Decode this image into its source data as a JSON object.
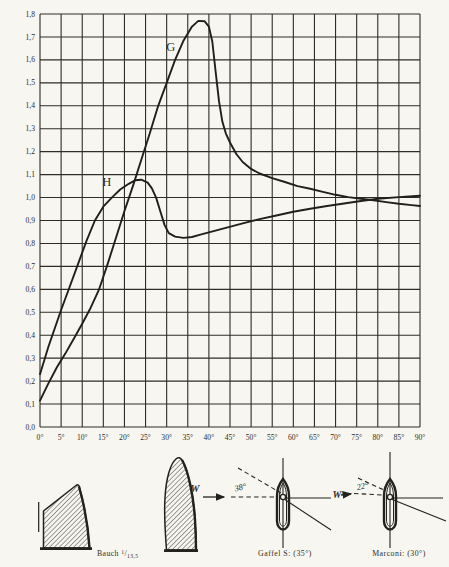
{
  "page": {
    "description_colors": {
      "paper": "#f8f6f1",
      "ink": "#23221c"
    }
  },
  "chart_data": {
    "type": "line",
    "title": "",
    "xlabel": "",
    "ylabel": "",
    "xlim": [
      0,
      90
    ],
    "ylim": [
      0,
      1.8
    ],
    "grid": "on",
    "x_ticks": [
      "0°",
      "5°",
      "10°",
      "15°",
      "20°",
      "25°",
      "30°",
      "35°",
      "40°",
      "45°",
      "50°",
      "55°",
      "60°",
      "65°",
      "70°",
      "75°",
      "80°",
      "85°",
      "90°"
    ],
    "y_ticks": [
      "0,0",
      "0,1",
      "0,2",
      "0,3",
      "0,4",
      "0,5",
      "0,6",
      "0,7",
      "0,8",
      "0,9",
      "1,0",
      "1,1",
      "1,2",
      "1,3",
      "1,4",
      "1,5",
      "1,6",
      "1,7",
      "1,8"
    ],
    "series": [
      {
        "name": "G",
        "label_pos": [
          31,
          1.64
        ],
        "points": [
          [
            0,
            0.115
          ],
          [
            2,
            0.19
          ],
          [
            4,
            0.26
          ],
          [
            6,
            0.32
          ],
          [
            8,
            0.385
          ],
          [
            10,
            0.45
          ],
          [
            12,
            0.52
          ],
          [
            14,
            0.6
          ],
          [
            16,
            0.71
          ],
          [
            18,
            0.825
          ],
          [
            20,
            0.94
          ],
          [
            22,
            1.05
          ],
          [
            24,
            1.165
          ],
          [
            26,
            1.28
          ],
          [
            28,
            1.4
          ],
          [
            30,
            1.5
          ],
          [
            32,
            1.6
          ],
          [
            34,
            1.685
          ],
          [
            36,
            1.745
          ],
          [
            37.5,
            1.77
          ],
          [
            39,
            1.768
          ],
          [
            40,
            1.745
          ],
          [
            40.8,
            1.68
          ],
          [
            41.6,
            1.55
          ],
          [
            42.4,
            1.42
          ],
          [
            43.2,
            1.33
          ],
          [
            44,
            1.28
          ],
          [
            45,
            1.24
          ],
          [
            46.5,
            1.19
          ],
          [
            48,
            1.155
          ],
          [
            50,
            1.125
          ],
          [
            52,
            1.105
          ],
          [
            55,
            1.085
          ],
          [
            58,
            1.068
          ],
          [
            61,
            1.05
          ],
          [
            64,
            1.038
          ],
          [
            67,
            1.025
          ],
          [
            70,
            1.012
          ],
          [
            73,
            1.002
          ],
          [
            76,
            0.995
          ],
          [
            79,
            0.988
          ],
          [
            82,
            0.98
          ],
          [
            85,
            0.973
          ],
          [
            88,
            0.967
          ],
          [
            90,
            0.963
          ]
        ]
      },
      {
        "name": "H",
        "label_pos": [
          15.8,
          1.05
        ],
        "points": [
          [
            0,
            0.23
          ],
          [
            2,
            0.35
          ],
          [
            5,
            0.51
          ],
          [
            7,
            0.61
          ],
          [
            9,
            0.71
          ],
          [
            11,
            0.81
          ],
          [
            13,
            0.9
          ],
          [
            15,
            0.96
          ],
          [
            17,
            1.0
          ],
          [
            19,
            1.035
          ],
          [
            21,
            1.06
          ],
          [
            22.5,
            1.075
          ],
          [
            24,
            1.078
          ],
          [
            25.5,
            1.065
          ],
          [
            26.5,
            1.04
          ],
          [
            27.5,
            1.0
          ],
          [
            28.5,
            0.94
          ],
          [
            29.5,
            0.88
          ],
          [
            30.5,
            0.845
          ],
          [
            32,
            0.83
          ],
          [
            34,
            0.824
          ],
          [
            36,
            0.828
          ],
          [
            38,
            0.838
          ],
          [
            40,
            0.848
          ],
          [
            44,
            0.868
          ],
          [
            48,
            0.888
          ],
          [
            52,
            0.906
          ],
          [
            56,
            0.922
          ],
          [
            60,
            0.938
          ],
          [
            64,
            0.951
          ],
          [
            68,
            0.963
          ],
          [
            72,
            0.974
          ],
          [
            76,
            0.985
          ],
          [
            80,
            0.995
          ],
          [
            85,
            1.002
          ],
          [
            90,
            1.008
          ]
        ]
      }
    ]
  },
  "footer": {
    "bauch": {
      "word": "Bauch",
      "numerator": "1",
      "slash": "/",
      "denominator": "13,5"
    },
    "gaffel_caption": "Gaffel S: (35°)",
    "marconi_caption": "Marconi: (30°)",
    "left_wind_letter": "W",
    "right_wind_letter": "W",
    "left_angle": "38°",
    "right_angle": "22°"
  }
}
